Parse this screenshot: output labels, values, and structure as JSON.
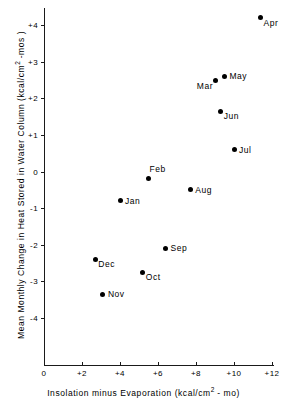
{
  "chart_data": {
    "type": "scatter",
    "title": "",
    "xlabel_parts": {
      "pre": "Insolation  minus  Evaporation  (kcal/cm",
      "sup": "2",
      "post": " - mo)"
    },
    "ylabel_parts": {
      "pre": "Mean Monthly Change in Heat Stored in Water Column (kcal/cm",
      "sup": "2",
      "post": " -mos )"
    },
    "xlabel": "Insolation minus Evaporation (kcal/cm2 - mo)",
    "ylabel": "Mean Monthly Change in Heat Stored in Water Column (kcal/cm2 -mos )",
    "xlim": [
      0,
      12
    ],
    "ylim": [
      -4.4,
      4.4
    ],
    "xticks": [
      0,
      2,
      4,
      6,
      8,
      10,
      12
    ],
    "xticklabels": [
      "0",
      "+2",
      "+4",
      "+6",
      "+8",
      "+10",
      "+12"
    ],
    "yticks": [
      4,
      3,
      2,
      1,
      0,
      -1,
      -2,
      -3,
      -4
    ],
    "yticklabels": [
      "+4",
      "+3",
      "+2",
      "+1",
      "0",
      "-1",
      "-2",
      "-3",
      "-4"
    ],
    "grid": false,
    "legend": "none",
    "marker_color": "#000000",
    "points": [
      {
        "label": "Apr",
        "x": 11.4,
        "y": 4.2,
        "label_pos": "br"
      },
      {
        "label": "May",
        "x": 9.5,
        "y": 2.6,
        "label_pos": "right"
      },
      {
        "label": "Mar",
        "x": 9.0,
        "y": 2.5,
        "label_pos": "bl"
      },
      {
        "label": "Jun",
        "x": 9.3,
        "y": 1.65,
        "label_pos": "br"
      },
      {
        "label": "Jul",
        "x": 10.0,
        "y": 0.6,
        "label_pos": "right"
      },
      {
        "label": "Feb",
        "x": 5.5,
        "y": -0.2,
        "label_pos": "above"
      },
      {
        "label": "Aug",
        "x": 7.7,
        "y": -0.5,
        "label_pos": "right"
      },
      {
        "label": "Jan",
        "x": 4.0,
        "y": -0.8,
        "label_pos": "right"
      },
      {
        "label": "Sep",
        "x": 6.4,
        "y": -2.1,
        "label_pos": "right"
      },
      {
        "label": "Oct",
        "x": 5.2,
        "y": -2.75,
        "label_pos": "br"
      },
      {
        "label": "Dec",
        "x": 2.7,
        "y": -2.4,
        "label_pos": "br"
      },
      {
        "label": "Nov",
        "x": 3.1,
        "y": -3.35,
        "label_pos": "right"
      }
    ]
  },
  "axes_geometry": {
    "x_origin_px": 44,
    "y_origin_px": 365,
    "px_per_x_unit": 19.0,
    "px_per_y_unit": 36.6,
    "y_zero_px": 171.5
  }
}
